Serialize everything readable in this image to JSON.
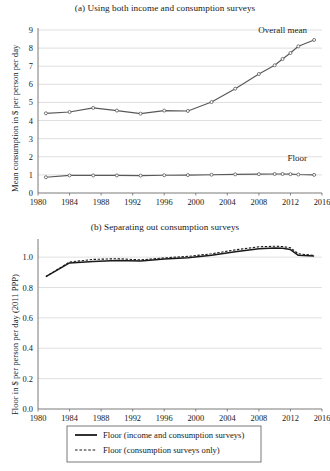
{
  "figure": {
    "panels": [
      {
        "key": "a",
        "title": "(a) Using both income and consumption surveys",
        "ylabel": "Mean consumption in $ per person per  day",
        "annotations": [
          {
            "name": "overall-mean-label",
            "text": "Overall mean"
          },
          {
            "name": "floor-label",
            "text": "Floor"
          }
        ]
      },
      {
        "key": "b",
        "title": "(b) Separating out consumption surveys",
        "ylabel": "Floor in $ per person per day (2011 PPP)"
      }
    ],
    "legend": {
      "items": [
        {
          "label": "Floor (income and consumption surveys)",
          "style": "solid"
        },
        {
          "label": "Floor (consumption surveys only)",
          "style": "dashed"
        }
      ]
    }
  },
  "chart_data": [
    {
      "type": "line",
      "title": "(a) Using both income and consumption surveys",
      "xlabel": "",
      "ylabel": "Mean consumption in $ per person per  day",
      "xlim": [
        1980,
        2016
      ],
      "ylim": [
        0,
        9
      ],
      "xticks": [
        1980,
        1984,
        1988,
        1992,
        1996,
        2000,
        2004,
        2008,
        2012,
        2016
      ],
      "yticks": [
        0,
        1,
        2,
        3,
        4,
        5,
        6,
        7,
        8,
        9
      ],
      "grid": "horizontal",
      "legend_position": "inline-annotations",
      "markers": "open-circle",
      "series": [
        {
          "name": "Overall mean",
          "x": [
            1981,
            1984,
            1987,
            1990,
            1993,
            1996,
            1999,
            2002,
            2005,
            2008,
            2010,
            2011,
            2012,
            2013,
            2015
          ],
          "values": [
            4.4,
            4.47,
            4.7,
            4.55,
            4.38,
            4.55,
            4.53,
            5.02,
            5.76,
            6.57,
            7.05,
            7.4,
            7.73,
            8.1,
            8.45
          ]
        },
        {
          "name": "Floor",
          "x": [
            1981,
            1984,
            1987,
            1990,
            1993,
            1996,
            1999,
            2002,
            2005,
            2008,
            2010,
            2011,
            2012,
            2013,
            2015
          ],
          "values": [
            0.87,
            0.97,
            0.97,
            0.97,
            0.96,
            0.98,
            0.99,
            1.01,
            1.03,
            1.04,
            1.05,
            1.05,
            1.04,
            1.02,
            1.0
          ]
        }
      ]
    },
    {
      "type": "line",
      "title": "(b) Separating out consumption surveys",
      "xlabel": "",
      "ylabel": "Floor in $ per person per day (2011 PPP)",
      "xlim": [
        1980,
        2016
      ],
      "ylim": [
        0.0,
        1.0
      ],
      "xticks": [
        1980,
        1984,
        1988,
        1992,
        1996,
        2000,
        2004,
        2008,
        2012,
        2016
      ],
      "yticks": [
        0.0,
        0.2,
        0.4,
        0.6,
        0.8,
        1.0
      ],
      "grid": "horizontal",
      "legend_position": "below",
      "series": [
        {
          "name": "Floor (income and consumption surveys)",
          "style": "solid",
          "x": [
            1981,
            1984,
            1987,
            1990,
            1993,
            1996,
            1999,
            2002,
            2005,
            2008,
            2010,
            2011,
            2012,
            2013,
            2015
          ],
          "values": [
            0.872,
            0.962,
            0.972,
            0.978,
            0.975,
            0.988,
            0.996,
            1.012,
            1.035,
            1.055,
            1.06,
            1.058,
            1.05,
            1.012,
            1.008
          ]
        },
        {
          "name": "Floor (consumption surveys only)",
          "style": "dashed",
          "x": [
            1981,
            1984,
            1987,
            1990,
            1993,
            1996,
            1999,
            2002,
            2005,
            2008,
            2010,
            2011,
            2012,
            2013,
            2015
          ],
          "values": [
            0.872,
            0.968,
            0.985,
            0.99,
            0.982,
            0.995,
            1.005,
            1.022,
            1.048,
            1.068,
            1.072,
            1.07,
            1.062,
            1.022,
            1.012
          ]
        }
      ]
    }
  ],
  "axis_a": {
    "ytick_labels": [
      "0",
      "1",
      "2",
      "3",
      "4",
      "5",
      "6",
      "7",
      "8",
      "9"
    ],
    "xtick_labels": [
      "1980",
      "1984",
      "1988",
      "1992",
      "1996",
      "2000",
      "2004",
      "2008",
      "2012",
      "2016"
    ]
  },
  "axis_b": {
    "ytick_labels": [
      "0.0",
      "0.2",
      "0.4",
      "0.6",
      "0.8",
      "1.0"
    ],
    "xtick_labels": [
      "1980",
      "1984",
      "1988",
      "1992",
      "1996",
      "2000",
      "2004",
      "2008",
      "2012",
      "2016"
    ]
  }
}
